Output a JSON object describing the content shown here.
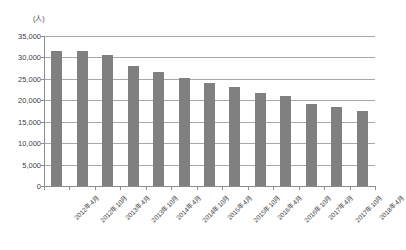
{
  "chart_data": {
    "type": "bar",
    "title": "",
    "subtitle": "",
    "unit_label": "(人)",
    "xlabel": "",
    "ylabel": "",
    "ylim": [
      0,
      35000
    ],
    "ytick_step": 5000,
    "grid": true,
    "legend": "none",
    "bar_color": "#808080",
    "gridline_color": "#a8a8a8",
    "axis_color": "#8d8d8d",
    "ytick_labels": [
      "35,000",
      "30,000",
      "25,000",
      "20,000",
      "15,000",
      "10,000",
      "5,000",
      "0"
    ],
    "ytick_values": [
      35000,
      30000,
      25000,
      20000,
      15000,
      10000,
      5000,
      0
    ],
    "categories": [
      "2012年4月",
      "2012年10月",
      "2013年4月",
      "2013年10月",
      "2014年4月",
      "2014年10月",
      "2015年4月",
      "2015年10月",
      "2016年4月",
      "2016年10月",
      "2017年4月",
      "2017年10月",
      "2018年4月"
    ],
    "values": [
      31500,
      31400,
      30600,
      27900,
      26500,
      25300,
      24100,
      23100,
      21700,
      20900,
      19100,
      18400,
      17600
    ]
  }
}
